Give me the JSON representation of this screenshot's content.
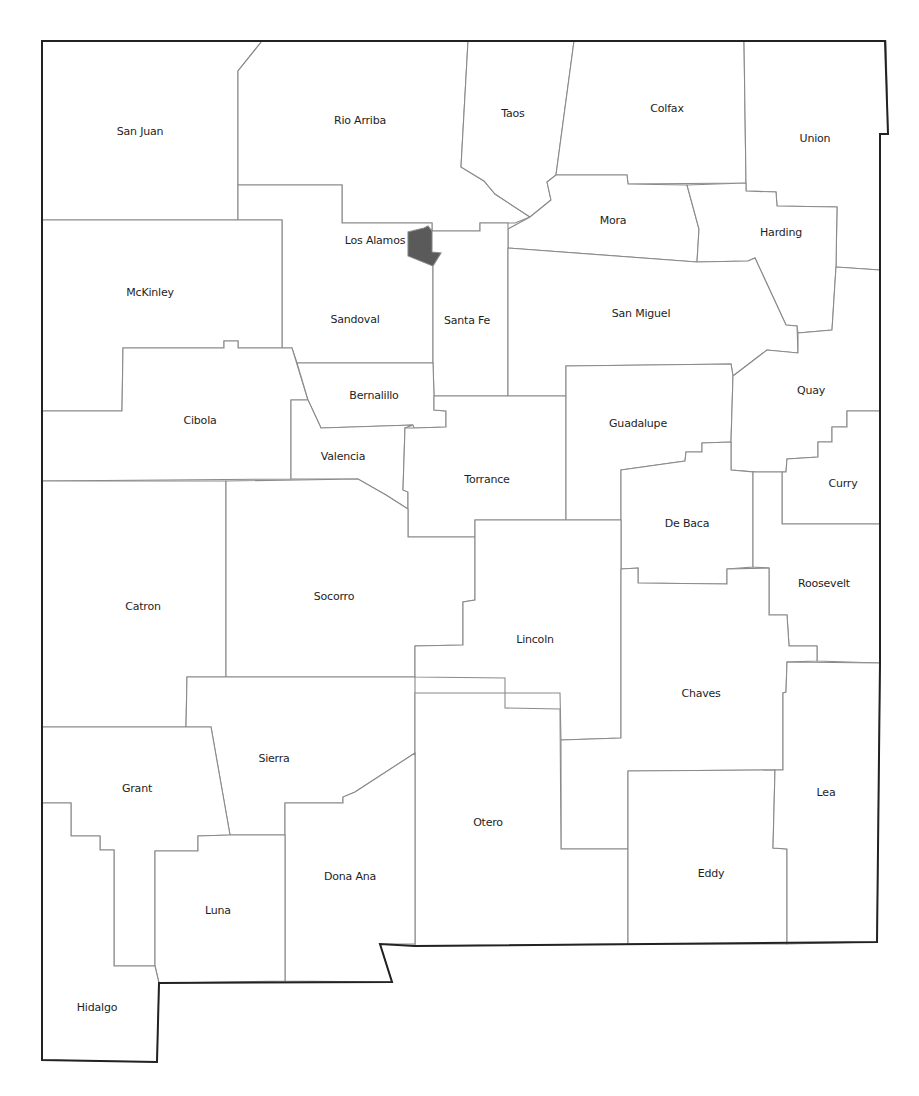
{
  "map": {
    "state": "New Mexico",
    "highlighted_county": "Los Alamos",
    "colors": {
      "background": "#ffffff",
      "county_fill": "#ffffff",
      "county_border": "#8a8a8a",
      "state_border": "#222222",
      "highlight_fill": "#5a5a5a",
      "label_text": "#1e1e1e"
    },
    "counties": [
      {
        "name": "San Juan",
        "label_x": 140,
        "label_y": 131
      },
      {
        "name": "Rio Arriba",
        "label_x": 360,
        "label_y": 120
      },
      {
        "name": "Taos",
        "label_x": 513,
        "label_y": 113
      },
      {
        "name": "Colfax",
        "label_x": 667,
        "label_y": 108
      },
      {
        "name": "Union",
        "label_x": 815,
        "label_y": 138
      },
      {
        "name": "Los Alamos",
        "label_x": 375,
        "label_y": 240,
        "highlighted": true
      },
      {
        "name": "Mora",
        "label_x": 613,
        "label_y": 220
      },
      {
        "name": "Harding",
        "label_x": 781,
        "label_y": 232
      },
      {
        "name": "McKinley",
        "label_x": 150,
        "label_y": 292
      },
      {
        "name": "Sandoval",
        "label_x": 355,
        "label_y": 319
      },
      {
        "name": "Santa Fe",
        "label_x": 467,
        "label_y": 320
      },
      {
        "name": "San Miguel",
        "label_x": 641,
        "label_y": 313
      },
      {
        "name": "Bernalillo",
        "label_x": 374,
        "label_y": 395
      },
      {
        "name": "Cibola",
        "label_x": 200,
        "label_y": 420
      },
      {
        "name": "Quay",
        "label_x": 811,
        "label_y": 390
      },
      {
        "name": "Guadalupe",
        "label_x": 638,
        "label_y": 423
      },
      {
        "name": "Valencia",
        "label_x": 343,
        "label_y": 456
      },
      {
        "name": "Torrance",
        "label_x": 487,
        "label_y": 479
      },
      {
        "name": "Curry",
        "label_x": 843,
        "label_y": 483
      },
      {
        "name": "De Baca",
        "label_x": 687,
        "label_y": 523
      },
      {
        "name": "Catron",
        "label_x": 143,
        "label_y": 606
      },
      {
        "name": "Socorro",
        "label_x": 334,
        "label_y": 596
      },
      {
        "name": "Roosevelt",
        "label_x": 824,
        "label_y": 583
      },
      {
        "name": "Lincoln",
        "label_x": 535,
        "label_y": 639
      },
      {
        "name": "Chaves",
        "label_x": 701,
        "label_y": 693
      },
      {
        "name": "Sierra",
        "label_x": 274,
        "label_y": 758
      },
      {
        "name": "Grant",
        "label_x": 137,
        "label_y": 788
      },
      {
        "name": "Lea",
        "label_x": 826,
        "label_y": 792
      },
      {
        "name": "Otero",
        "label_x": 488,
        "label_y": 822
      },
      {
        "name": "Eddy",
        "label_x": 711,
        "label_y": 873
      },
      {
        "name": "Dona Ana",
        "label_x": 350,
        "label_y": 876
      },
      {
        "name": "Luna",
        "label_x": 218,
        "label_y": 910
      },
      {
        "name": "Hidalgo",
        "label_x": 97,
        "label_y": 1007
      }
    ]
  }
}
